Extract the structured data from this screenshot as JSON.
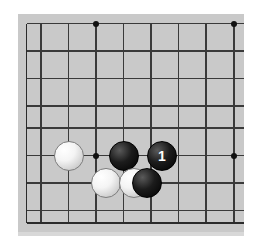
{
  "diagram": {
    "type": "go-board-diagram",
    "board_size": 19,
    "visible_region": "bottom-right portion of board, cropped",
    "colors": {
      "board_background": "#c9c9c9",
      "grid_line": "#3a3a3a",
      "edge_line": "#2b2b2b",
      "star_point": "#111111",
      "black_stone": "#000000",
      "white_stone": "#ffffff",
      "page_background": "#ffffff",
      "label_text": "#ffffff"
    },
    "geometry": {
      "surface": {
        "left": 18,
        "top": 14,
        "width": 226,
        "height": 218
      },
      "column_x": [
        26.5,
        41,
        68.5,
        96,
        123.5,
        151,
        178.5,
        206,
        234
      ],
      "row_y": [
        23.5,
        51,
        78.5,
        106,
        128,
        155.5,
        183,
        210.5,
        223
      ],
      "spacing": 27.5
    },
    "grid": {
      "vertical_lines": [
        26.5,
        41,
        68.5,
        96,
        123.5,
        151,
        178.5,
        206,
        234
      ],
      "vertical_top": 23.5,
      "vertical_bottom": 223,
      "horizontal_lines": [
        23.5,
        51,
        78.5,
        106,
        128,
        155.5,
        183,
        210.5,
        223
      ],
      "horizontal_left": 26.5,
      "horizontal_right": 244
    },
    "star_points": [
      {
        "name": "star-point-top-left",
        "x": 96,
        "y": 23.5
      },
      {
        "name": "star-point-top-right",
        "x": 234,
        "y": 23.5
      },
      {
        "name": "star-point-center-left",
        "x": 96,
        "y": 155.5
      },
      {
        "name": "star-point-center-right",
        "x": 234,
        "y": 155.5
      }
    ],
    "stones": [
      {
        "name": "white-stone-1",
        "color": "white",
        "x": 68.5,
        "y": 155.5,
        "radius": 15,
        "label": ""
      },
      {
        "name": "black-stone-1",
        "color": "black",
        "x": 123.5,
        "y": 155.5,
        "radius": 15,
        "label": ""
      },
      {
        "name": "black-stone-numbered-1",
        "color": "black",
        "x": 162,
        "y": 155.5,
        "radius": 15,
        "label": "1"
      },
      {
        "name": "white-stone-2",
        "color": "white",
        "x": 106,
        "y": 183,
        "radius": 15,
        "label": ""
      },
      {
        "name": "white-stone-3",
        "color": "white",
        "x": 134,
        "y": 183,
        "radius": 15,
        "label": ""
      },
      {
        "name": "black-stone-2",
        "color": "black",
        "x": 147,
        "y": 183,
        "radius": 15,
        "label": ""
      }
    ],
    "move_labels": [
      {
        "number": "1",
        "stone": "black-stone-numbered-1"
      }
    ]
  }
}
